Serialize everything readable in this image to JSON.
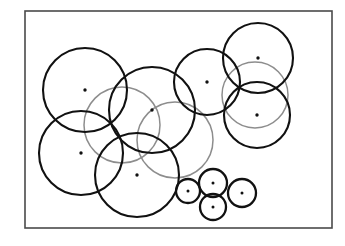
{
  "figure": {
    "title": "Overlapping disk coverage diagram",
    "background_color": "#ffffff",
    "frame": {
      "name": "figure-border",
      "x": 25,
      "y": 11,
      "width": 307,
      "height": 217,
      "stroke_color": "#4a4a4a",
      "stroke_width": 1.6
    },
    "stroke_color_primary": "#111111",
    "stroke_color_secondary": "#8d8d8d",
    "dot_color": "#111111",
    "dot_radius": 1.7
  },
  "chart_data": {
    "type": "scatter",
    "title": "Overlapping disk coverage diagram",
    "xlabel": "",
    "ylabel": "",
    "xlim": [
      25,
      332
    ],
    "ylim": [
      11,
      228
    ],
    "grid": false,
    "legend": false,
    "note": "Each data point is a disk center; radius encodes coverage radius. Coordinates in image pixels, y increases downward.",
    "categories": [
      "large-disk",
      "small-disk"
    ],
    "series": [
      {
        "name": "large-disk",
        "points": [
          {
            "id": "A",
            "label": "top-left-large-disk",
            "cx": 85,
            "cy": 90,
            "r": 42,
            "tone": "dark"
          },
          {
            "id": "B",
            "label": "center-left-large-disk",
            "cx": 152,
            "cy": 110,
            "r": 43,
            "tone": "dark"
          },
          {
            "id": "C",
            "label": "upper-middle-disk",
            "cx": 207,
            "cy": 82,
            "r": 33,
            "tone": "dark"
          },
          {
            "id": "D",
            "label": "top-right-disk",
            "cx": 258,
            "cy": 58,
            "r": 35,
            "tone": "dark"
          },
          {
            "id": "E",
            "label": "right-middle-disk",
            "cx": 257,
            "cy": 115,
            "r": 33,
            "tone": "dark"
          },
          {
            "id": "F",
            "label": "lower-left-large-disk",
            "cx": 81,
            "cy": 153,
            "r": 42,
            "tone": "dark"
          },
          {
            "id": "G",
            "label": "lower-middle-large-disk",
            "cx": 137,
            "cy": 175,
            "r": 42,
            "tone": "dark"
          }
        ]
      },
      {
        "name": "small-disk",
        "points": [
          {
            "id": "H",
            "label": "small-disk-left",
            "cx": 188,
            "cy": 191,
            "r": 12,
            "tone": "dark"
          },
          {
            "id": "I",
            "label": "small-disk-top",
            "cx": 213,
            "cy": 183,
            "r": 14,
            "tone": "dark"
          },
          {
            "id": "J",
            "label": "small-disk-bottom",
            "cx": 213,
            "cy": 207,
            "r": 13,
            "tone": "dark"
          },
          {
            "id": "K",
            "label": "small-disk-right",
            "cx": 242,
            "cy": 193,
            "r": 14,
            "tone": "dark"
          }
        ]
      }
    ],
    "faint_overlap_disks": [
      {
        "id": "a1",
        "label": "faint-disk-upper-left-overlap",
        "cx": 122,
        "cy": 125,
        "r": 38
      },
      {
        "id": "a2",
        "label": "faint-disk-mid-overlap",
        "cx": 175,
        "cy": 140,
        "r": 38
      },
      {
        "id": "a3",
        "label": "faint-disk-right-overlap",
        "cx": 255,
        "cy": 95,
        "r": 33
      }
    ],
    "counts": {
      "large_disks": 7,
      "small_disks": 4,
      "faint_overlap_disks": 3,
      "total_centers": 11
    }
  }
}
